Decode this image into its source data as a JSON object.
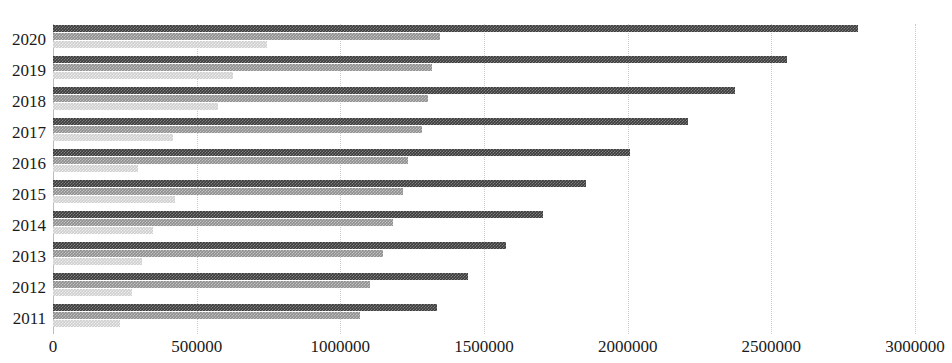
{
  "chart_data": {
    "type": "bar",
    "orientation": "horizontal",
    "title": "",
    "xlabel": "",
    "ylabel": "",
    "categories": [
      "2020",
      "2019",
      "2018",
      "2017",
      "2016",
      "2015",
      "2014",
      "2013",
      "2012",
      "2011"
    ],
    "series": [
      {
        "name": "series-1",
        "color": "#3b3b3b",
        "values": [
          2802000,
          2554000,
          2373000,
          2210000,
          2009000,
          1855000,
          1707000,
          1577000,
          1444000,
          1337000
        ]
      },
      {
        "name": "series-2",
        "color": "#8f8f8f",
        "values": [
          1347000,
          1319000,
          1306000,
          1284000,
          1236000,
          1218000,
          1184000,
          1149000,
          1103000,
          1068000
        ]
      },
      {
        "name": "series-3",
        "color": "#cfcfcf",
        "values": [
          745000,
          627000,
          575000,
          418000,
          296000,
          425000,
          348000,
          310000,
          275000,
          233000
        ]
      }
    ],
    "xlim": [
      0,
      3000000
    ],
    "xticks": [
      0,
      500000,
      1000000,
      1500000,
      2000000,
      2500000,
      3000000
    ],
    "xticklabels": [
      "0",
      "500000",
      "1000000",
      "1500000",
      "2000000",
      "2500000",
      "3000000"
    ],
    "grid": true,
    "gridstyle": "dotted-vertical",
    "legend": "none"
  }
}
